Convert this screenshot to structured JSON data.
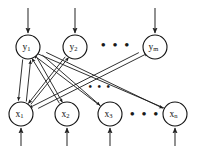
{
  "figure": {
    "layers": {
      "output_layer_name": "y-layer",
      "input_layer_name": "x-layer"
    },
    "colors": {
      "node_stroke": "#111111",
      "node_fill": "#ffffff",
      "edge": "#1a1a1a",
      "io_arrow": "#555555",
      "background": "#ffffff"
    }
  },
  "y_nodes": [
    {
      "id": "y1",
      "base": "y",
      "sub": "1",
      "cx": 28,
      "cy": 47,
      "r": 12
    },
    {
      "id": "y2",
      "base": "y",
      "sub": "2",
      "cx": 75,
      "cy": 47,
      "r": 12
    },
    {
      "id": "ym",
      "base": "y",
      "sub": "m",
      "cx": 155,
      "cy": 47,
      "r": 12
    }
  ],
  "x_nodes": [
    {
      "id": "x1",
      "base": "x",
      "sub": "1",
      "cx": 21,
      "cy": 114,
      "r": 12
    },
    {
      "id": "x2",
      "base": "x",
      "sub": "2",
      "cx": 67,
      "cy": 114,
      "r": 12
    },
    {
      "id": "x3",
      "base": "x",
      "sub": "3",
      "cx": 110,
      "cy": 114,
      "r": 12
    },
    {
      "id": "xn",
      "base": "x",
      "sub": "n",
      "cx": 175,
      "cy": 114,
      "r": 12
    }
  ],
  "ellipses": [
    {
      "id": "y-row-ellipsis",
      "text": "• • •",
      "cx": 116,
      "cy": 46
    },
    {
      "id": "x-row-ellipsis",
      "text": "• • •",
      "cx": 145,
      "cy": 115
    },
    {
      "id": "mid-ellipsis",
      "text": "• • •",
      "cx": 100,
      "cy": 88
    }
  ],
  "top_input_arrows": [
    {
      "id": "input-y1",
      "x": 28,
      "y_start": 8,
      "y_end": 33
    },
    {
      "id": "input-y2",
      "x": 75,
      "y_start": 8,
      "y_end": 33
    },
    {
      "id": "input-ym",
      "x": 155,
      "y_start": 8,
      "y_end": 33
    }
  ],
  "bottom_input_arrows": [
    {
      "id": "input-x1",
      "x": 21,
      "y_start": 146,
      "y_end": 128
    },
    {
      "id": "input-x2",
      "x": 67,
      "y_start": 146,
      "y_end": 128
    },
    {
      "id": "input-x3",
      "x": 110,
      "y_start": 146,
      "y_end": 128
    },
    {
      "id": "input-xn",
      "x": 175,
      "y_start": 146,
      "y_end": 128
    }
  ],
  "connections": [
    {
      "id": "y1-x1-down",
      "from": "y1",
      "to": "x1",
      "direction": "down"
    },
    {
      "id": "x1-y1-up",
      "from": "x1",
      "to": "y1",
      "direction": "up"
    },
    {
      "id": "y1-x2-down",
      "from": "y1",
      "to": "x2",
      "direction": "down"
    },
    {
      "id": "x2-y1-up",
      "from": "x2",
      "to": "y1",
      "direction": "up"
    },
    {
      "id": "y1-x3-down",
      "from": "y1",
      "to": "x3",
      "direction": "down"
    },
    {
      "id": "x3-y1-up",
      "from": "x3",
      "to": "y1",
      "direction": "up"
    },
    {
      "id": "y1-xn-down",
      "from": "y1",
      "to": "xn",
      "direction": "down"
    },
    {
      "id": "xn-y1-up",
      "from": "xn",
      "to": "y1",
      "direction": "up"
    },
    {
      "id": "x1-y2-up",
      "from": "x1",
      "to": "y2",
      "direction": "up"
    },
    {
      "id": "y2-x1-down",
      "from": "y2",
      "to": "x1",
      "direction": "down"
    },
    {
      "id": "x1-ym-up",
      "from": "x1",
      "to": "ym",
      "direction": "up"
    },
    {
      "id": "ym-x1-down",
      "from": "ym",
      "to": "x1",
      "direction": "down"
    }
  ]
}
